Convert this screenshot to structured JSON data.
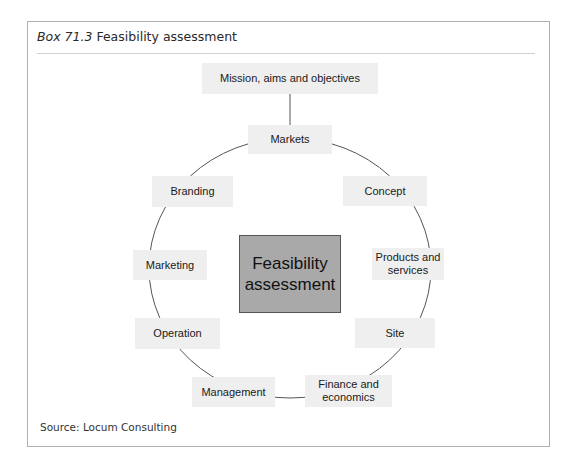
{
  "box": {
    "label_number": "Box 71.3",
    "label_title": "Feasibility assessment"
  },
  "diagram": {
    "center": "Feasibility assessment",
    "top": "Mission, aims and objectives",
    "cycle": [
      "Markets",
      "Concept",
      "Products and services",
      "Site",
      "Finance and economics",
      "Management",
      "Operation",
      "Marketing",
      "Branding"
    ],
    "colors": {
      "node_fill": "#efefef",
      "center_fill": "#a9a9a9",
      "line": "#555555"
    }
  },
  "source": "Source: Locum Consulting"
}
